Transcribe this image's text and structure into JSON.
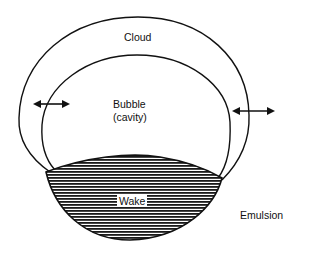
{
  "diagram": {
    "labels": {
      "cloud": "Cloud",
      "bubble_line1": "Bubble",
      "bubble_line2": "(cavity)",
      "wake": "Wake",
      "emulsion": "Emulsion"
    },
    "colors": {
      "stroke": "#111111",
      "hatch": "#1a1a1a",
      "background": "#ffffff"
    },
    "elements": [
      "cloud-boundary",
      "bubble-boundary",
      "wake-region",
      "left-exchange-arrow",
      "right-exchange-arrow"
    ]
  }
}
